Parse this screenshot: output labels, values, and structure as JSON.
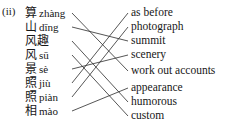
{
  "exercise": {
    "label": "(ii)",
    "type": "matching-exercise",
    "line_color": "#2b2b2b"
  },
  "left_column": [
    {
      "hanzi": "算",
      "pinyin": "zhàng",
      "y": 12
    },
    {
      "hanzi": "山",
      "pinyin": "dīng",
      "y": 26
    },
    {
      "hanzi": "风趣",
      "pinyin": "",
      "y": 40
    },
    {
      "hanzi": "风",
      "pinyin": "sū",
      "y": 54
    },
    {
      "hanzi": "景",
      "pinyin": "sè",
      "y": 68
    },
    {
      "hanzi": "照",
      "pinyin": "jiù",
      "y": 82
    },
    {
      "hanzi": "照",
      "pinyin": "piàn",
      "y": 96
    },
    {
      "hanzi": "相",
      "pinyin": "mào",
      "y": 110
    }
  ],
  "right_column": [
    {
      "text": "as before",
      "y": 12
    },
    {
      "text": "photograph",
      "y": 26
    },
    {
      "text": "summit",
      "y": 40
    },
    {
      "text": "scenery",
      "y": 54
    },
    {
      "text": "work out accounts",
      "y": 70
    },
    {
      "text": "appearance",
      "y": 87
    },
    {
      "text": "humorous",
      "y": 101
    },
    {
      "text": "custom",
      "y": 115
    }
  ],
  "connections": [
    {
      "from": 0,
      "to": 4
    },
    {
      "from": 1,
      "to": 2
    },
    {
      "from": 2,
      "to": 6
    },
    {
      "from": 3,
      "to": 7
    },
    {
      "from": 4,
      "to": 3
    },
    {
      "from": 5,
      "to": 0
    },
    {
      "from": 6,
      "to": 1
    },
    {
      "from": 7,
      "to": 5
    }
  ]
}
